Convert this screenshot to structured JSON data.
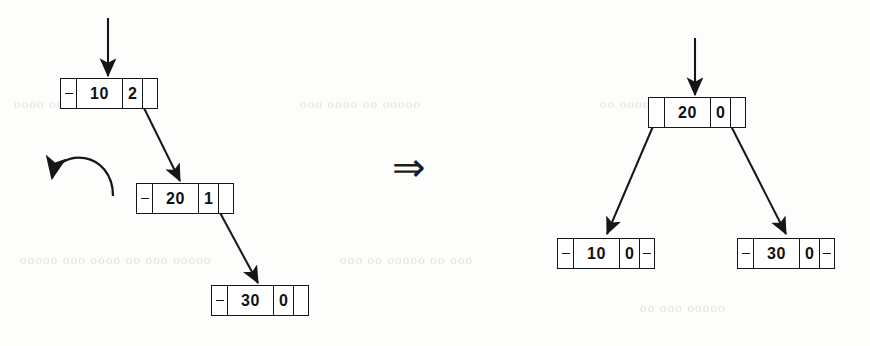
{
  "figure": {
    "implication_symbol": "⇒",
    "stroke_color": "#16161a",
    "background_color": "#fdfdfc",
    "null_marker": "-"
  },
  "before": {
    "caption": "",
    "root_inbound_arrow": true,
    "rotation_hint": "counter-clockwise-rotation-arrow",
    "nodes": [
      {
        "id": "before-node-10",
        "key": "10",
        "balance": "2",
        "left_null": "-",
        "right_null": "",
        "x": 60,
        "y": 78
      },
      {
        "id": "before-node-20",
        "key": "20",
        "balance": "1",
        "left_null": "-",
        "right_null": "",
        "x": 136,
        "y": 183
      },
      {
        "id": "before-node-30",
        "key": "30",
        "balance": "0",
        "left_null": "-",
        "right_null": "",
        "x": 211,
        "y": 285
      }
    ]
  },
  "after": {
    "caption": "",
    "root_inbound_arrow": true,
    "nodes": [
      {
        "id": "after-node-20",
        "key": "20",
        "balance": "0",
        "left_null": "",
        "right_null": "",
        "x": 648,
        "y": 97
      },
      {
        "id": "after-node-10",
        "key": "10",
        "balance": "0",
        "left_null": "-",
        "right_null": "-",
        "x": 557,
        "y": 238
      },
      {
        "id": "after-node-30",
        "key": "30",
        "balance": "0",
        "left_null": "-",
        "right_null": "-",
        "x": 737,
        "y": 238
      }
    ]
  },
  "bleed_through": [
    {
      "text": "oooo  ooo oooo oo ooo",
      "x": 14,
      "y": 96
    },
    {
      "text": "ooo oooo oo ooooo",
      "x": 300,
      "y": 96
    },
    {
      "text": "oo ooooo oo ooo",
      "x": 600,
      "y": 96
    },
    {
      "text": "ooooo   ooo oooo oo ooo ooooo",
      "x": 20,
      "y": 252
    },
    {
      "text": "ooo oo ooooo oo ooo",
      "x": 340,
      "y": 252
    },
    {
      "text": "oo ooo ooooo",
      "x": 640,
      "y": 300
    }
  ]
}
